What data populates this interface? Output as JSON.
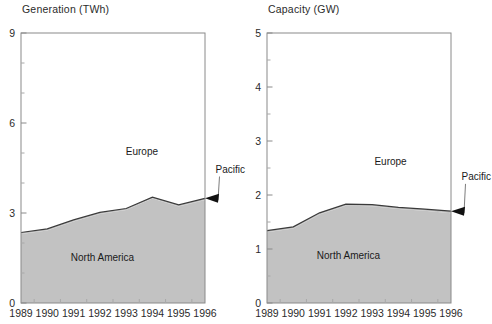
{
  "chart_data": [
    {
      "type": "area",
      "id": "generation",
      "title": "Generation  (TWh)",
      "xlabel": "",
      "ylabel": "",
      "ylim": [
        0,
        9
      ],
      "ytick_major": [
        0,
        3,
        6,
        9
      ],
      "ytick_major_labels": [
        "0",
        "3",
        "6",
        "9"
      ],
      "ytick_minor": [
        1,
        2,
        4,
        5,
        7,
        8
      ],
      "grid": false,
      "categories": [
        "1989",
        "1990",
        "1991",
        "1992",
        "1993",
        "1994",
        "1995",
        "1996"
      ],
      "x": [
        1989,
        1990,
        1991,
        1992,
        1993,
        1994,
        1995,
        1996
      ],
      "legend_position": "inline-annotations",
      "series": [
        {
          "name": "North America",
          "values": [
            2.3,
            2.42,
            2.72,
            2.97,
            3.1,
            3.48,
            3.22,
            3.43
          ]
        },
        {
          "name": "Pacific",
          "values": [
            0.05,
            0.05,
            0.05,
            0.05,
            0.05,
            0.05,
            0.05,
            0.06
          ]
        },
        {
          "name": "Europe",
          "values": [
            0.18,
            0.3,
            0.42,
            0.56,
            0.72,
            0.85,
            1.05,
            1.2
          ]
        }
      ],
      "annotations": [
        {
          "text": "Europe",
          "x": 1993.6,
          "y": 4.95,
          "kind": "area-label"
        },
        {
          "text": "North America",
          "x": 1992.1,
          "y": 1.4,
          "kind": "area-label"
        },
        {
          "text": "Pacific",
          "x": 1996.4,
          "y": 4.35,
          "kind": "callout",
          "arrow_to_x": 1996,
          "arrow_to_y": 3.49
        }
      ]
    },
    {
      "type": "area",
      "id": "capacity",
      "title": "Capacity (GW)",
      "xlabel": "",
      "ylabel": "",
      "ylim": [
        0,
        5
      ],
      "ytick_major": [
        0,
        1,
        2,
        3,
        4,
        5
      ],
      "ytick_major_labels": [
        "0",
        "1",
        "2",
        "3",
        "4",
        "5"
      ],
      "ytick_minor": [
        0.5,
        1.5,
        2.5,
        3.5,
        4.5
      ],
      "grid": false,
      "categories": [
        "1989",
        "1990",
        "1991",
        "1992",
        "1993",
        "1994",
        "1995",
        "1996"
      ],
      "x": [
        1989,
        1990,
        1991,
        1992,
        1993,
        1994,
        1995,
        1996
      ],
      "legend_position": "inline-annotations",
      "series": [
        {
          "name": "North America",
          "values": [
            1.31,
            1.38,
            1.64,
            1.8,
            1.79,
            1.74,
            1.71,
            1.66
          ]
        },
        {
          "name": "Pacific",
          "values": [
            0.03,
            0.03,
            0.03,
            0.03,
            0.03,
            0.03,
            0.03,
            0.04
          ]
        },
        {
          "name": "Europe",
          "values": [
            0.1,
            0.17,
            0.24,
            0.32,
            0.42,
            0.52,
            0.64,
            0.75
          ]
        }
      ],
      "annotations": [
        {
          "text": "Europe",
          "x": 1993.7,
          "y": 2.55,
          "kind": "area-label"
        },
        {
          "text": "North America",
          "x": 1992.1,
          "y": 0.82,
          "kind": "area-label"
        },
        {
          "text": "Pacific",
          "x": 1996.4,
          "y": 2.28,
          "kind": "callout",
          "arrow_to_x": 1996,
          "arrow_to_y": 1.7
        }
      ]
    }
  ],
  "colors": {
    "fill_gray": "#c2c2c2",
    "fill_white": "#ffffff",
    "frame": "#8a8a8a",
    "text": "#1a1a1a",
    "background": "#ffffff"
  }
}
